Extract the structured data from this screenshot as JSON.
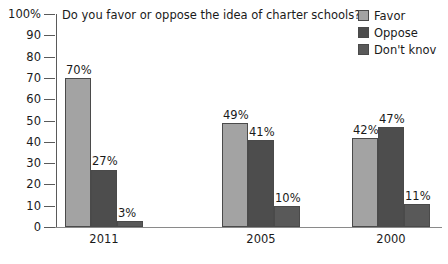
{
  "chart_data": {
    "type": "bar",
    "title": "Do you favor or oppose the idea of charter schools?",
    "xlabel": "",
    "ylabel": "",
    "ylim": [
      0,
      100
    ],
    "ytick_labels": [
      "100%",
      "90",
      "80",
      "70",
      "60",
      "50",
      "40",
      "30",
      "20",
      "10",
      "0"
    ],
    "ytick_values": [
      100,
      90,
      80,
      70,
      60,
      50,
      40,
      30,
      20,
      10,
      0
    ],
    "grid": false,
    "legend_position": "top-right",
    "categories": [
      "2011",
      "2005",
      "2000"
    ],
    "series": [
      {
        "name": "Favor",
        "color": "#a3a3a3",
        "values": [
          70,
          49,
          42
        ],
        "labels": [
          "70%",
          "49%",
          "42%"
        ]
      },
      {
        "name": "Oppose",
        "color": "#4d4d4d",
        "values": [
          27,
          41,
          47
        ],
        "labels": [
          "27%",
          "41%",
          "47%"
        ]
      },
      {
        "name": "Don't knov",
        "color": "#595959",
        "values": [
          3,
          10,
          11
        ],
        "labels": [
          "3%",
          "10%",
          "11%"
        ]
      }
    ]
  },
  "legend": {
    "items": [
      {
        "label": "Favor",
        "color": "#a3a3a3"
      },
      {
        "label": "Oppose",
        "color": "#4d4d4d"
      },
      {
        "label": "Don't knov",
        "color": "#595959"
      }
    ]
  },
  "axis": {
    "y_labels": [
      "100%",
      "90",
      "80",
      "70",
      "60",
      "50",
      "40",
      "30",
      "20",
      "10",
      "0"
    ],
    "x_labels": [
      "2011",
      "2005",
      "2000"
    ]
  },
  "values": {
    "g0s0": "70%",
    "g0s1": "27%",
    "g0s2": "3%",
    "g1s0": "49%",
    "g1s1": "41%",
    "g1s2": "10%",
    "g2s0": "42%",
    "g2s1": "47%",
    "g2s2": "11%"
  }
}
